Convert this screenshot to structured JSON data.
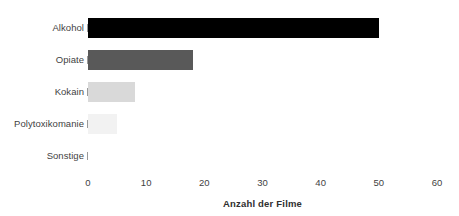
{
  "chart_data": {
    "type": "bar",
    "orientation": "horizontal",
    "title": "",
    "xlabel": "Anzahl der Filme",
    "ylabel": "",
    "xlim": [
      0,
      60
    ],
    "xticks": [
      0,
      10,
      20,
      30,
      40,
      50,
      60
    ],
    "grid": false,
    "legend": null,
    "categories": [
      "Alkohol",
      "Opiate",
      "Kokain",
      "Polytoxikomanie",
      "Sonstige"
    ],
    "values": [
      50,
      18,
      8,
      5,
      0
    ],
    "bar_colors": [
      "#000000",
      "#595959",
      "#d9d9d9",
      "#f2f2f2",
      "#ffffff"
    ],
    "bars": [
      {
        "category": "Alkohol",
        "value": 50,
        "color": "#000000"
      },
      {
        "category": "Opiate",
        "value": 18,
        "color": "#595959"
      },
      {
        "category": "Kokain",
        "value": 8,
        "color": "#d9d9d9"
      },
      {
        "category": "Polytoxikomanie",
        "value": 5,
        "color": "#f2f2f2"
      },
      {
        "category": "Sonstige",
        "value": 0,
        "color": "#ffffff"
      }
    ]
  },
  "axis": {
    "tick_labels": [
      "0",
      "10",
      "20",
      "30",
      "40",
      "50",
      "60"
    ],
    "title": "Anzahl der Filme"
  },
  "categories": {
    "labels": [
      "Alkohol",
      "Opiate",
      "Kokain",
      "Polytoxikomanie",
      "Sonstige"
    ]
  },
  "colors": {
    "background": "#ffffff",
    "text": "#3f3f3f",
    "axis_title": "#2f2f2f",
    "tick_mark": "#9a9a9a"
  }
}
